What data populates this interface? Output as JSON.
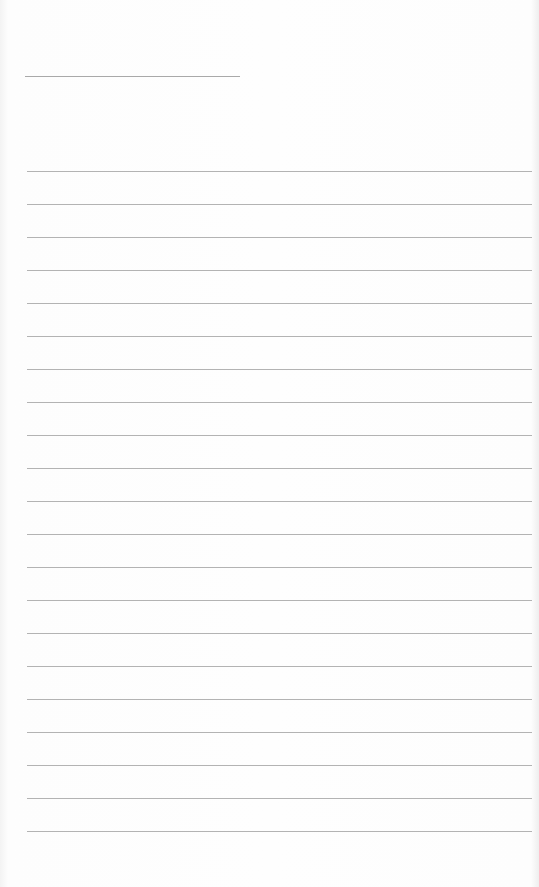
{
  "page": {
    "type": "lined-paper",
    "title_line": {
      "x": 25,
      "y": 76,
      "width": 215
    },
    "rules": {
      "count": 21,
      "start_y": 171,
      "spacing": 33,
      "x": 27,
      "width": 505,
      "color": "#b3b3b3"
    },
    "background": "#fbfbfb"
  }
}
